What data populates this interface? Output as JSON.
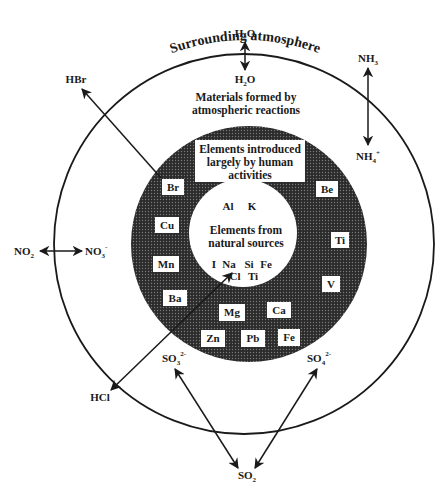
{
  "title": "Surrounding atmosphere",
  "zones": {
    "outer": "Materials formed by atmospheric reactions",
    "outer_lines": [
      "Materials formed by",
      "atmospheric reactions"
    ],
    "middle_lines": [
      "Elements introduced",
      "largely by human",
      "activities"
    ],
    "inner_lines": [
      "Elements from",
      "natural sources"
    ]
  },
  "natural_elements": {
    "top": [
      "Al",
      "K"
    ],
    "bottom_row1": [
      "I",
      "Na",
      "Si",
      "Fe"
    ],
    "bottom_row2": [
      "Cl",
      "Ti"
    ]
  },
  "human_elements": [
    "Br",
    "Cu",
    "Mn",
    "Ba",
    "Mg",
    "Ca",
    "Zn",
    "Pb",
    "Fe",
    "V",
    "Ti",
    "Be"
  ],
  "species": {
    "h2o_out": {
      "base": "H",
      "sub": "2",
      "tail": "O"
    },
    "h2o_in": {
      "base": "H",
      "sub": "2",
      "tail": "O"
    },
    "nh3": {
      "base": "NH",
      "sub": "3"
    },
    "nh4": {
      "base": "NH",
      "sub": "4",
      "sup": "+"
    },
    "hbr": "HBr",
    "no2": {
      "base": "NO",
      "sub": "2"
    },
    "no3": {
      "base": "NO",
      "sub": "3",
      "sup": "-"
    },
    "hcl": "HCl",
    "so3": {
      "base": "SO",
      "sub": "3",
      "sup": "2-"
    },
    "so4": {
      "base": "SO",
      "sub": "4",
      "sup": "2-"
    },
    "so2": {
      "base": "SO",
      "sub": "2"
    }
  },
  "colors": {
    "line": "#1a1a1a",
    "stipple_dark": "#2b2b2b",
    "stipple_light": "#6a6a6a",
    "background": "#ffffff"
  }
}
